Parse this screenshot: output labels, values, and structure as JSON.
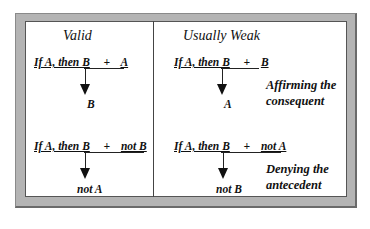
{
  "columns": [
    {
      "heading": "Valid",
      "rows": [
        {
          "antecedent": "If A, then B",
          "plus": "+",
          "premise": "A",
          "conclusion": "B"
        },
        {
          "antecedent": "If A, then B",
          "plus": "+",
          "premise": "not B",
          "conclusion": "not A"
        }
      ]
    },
    {
      "heading": "Usually Weak",
      "rows": [
        {
          "antecedent": "If A, then B",
          "plus": "+",
          "premise": "B",
          "conclusion": "A",
          "label_line1": "Affirming the",
          "label_line2": "consequent"
        },
        {
          "antecedent": "If A, then B",
          "plus": "+",
          "premise": "not A",
          "conclusion": "not B",
          "label_line1": "Denying the",
          "label_line2": "antecedent"
        }
      ]
    }
  ]
}
